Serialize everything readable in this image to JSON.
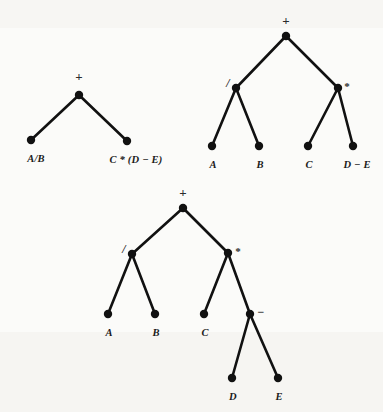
{
  "figure": {
    "background_color": "#fbfbf9",
    "ink_color": "#111111",
    "node_radius": 4.2,
    "edge_width": 2.6
  },
  "trees": [
    {
      "id": "tree-1",
      "caption": "Top-level tree: root plus with two compound operand leaves",
      "nodes": [
        {
          "id": "t1-root",
          "label": "+",
          "kind": "operator",
          "x": 79,
          "y": 95,
          "label_x": 79,
          "label_y": 77,
          "label_pos": "above"
        },
        {
          "id": "t1-left",
          "label": "A/B",
          "kind": "operand",
          "x": 31,
          "y": 140,
          "label_x": 36,
          "label_y": 153,
          "label_pos": "below"
        },
        {
          "id": "t1-right",
          "label": "C * (D − E)",
          "kind": "operand",
          "x": 127,
          "y": 141,
          "label_x": 136,
          "label_y": 154,
          "label_pos": "below"
        }
      ],
      "edges": [
        {
          "from": "t1-root",
          "to": "t1-left"
        },
        {
          "from": "t1-root",
          "to": "t1-right"
        }
      ]
    },
    {
      "id": "tree-2",
      "caption": "Second level of expansion: operators / and * expanded, D-E still a leaf",
      "nodes": [
        {
          "id": "t2-root",
          "label": "+",
          "kind": "operator",
          "x": 286,
          "y": 36,
          "label_x": 286,
          "label_y": 21,
          "label_pos": "above"
        },
        {
          "id": "t2-div",
          "label": "/",
          "kind": "operator",
          "x": 236,
          "y": 88,
          "label_x": 228,
          "label_y": 83,
          "label_pos": "left"
        },
        {
          "id": "t2-mul",
          "label": "*",
          "kind": "operator",
          "x": 338,
          "y": 88,
          "label_x": 347,
          "label_y": 86,
          "label_pos": "right"
        },
        {
          "id": "t2-a",
          "label": "A",
          "kind": "operand",
          "x": 212,
          "y": 146,
          "label_x": 213,
          "label_y": 159,
          "label_pos": "below"
        },
        {
          "id": "t2-b",
          "label": "B",
          "kind": "operand",
          "x": 259,
          "y": 146,
          "label_x": 260,
          "label_y": 159,
          "label_pos": "below"
        },
        {
          "id": "t2-c",
          "label": "C",
          "kind": "operand",
          "x": 308,
          "y": 146,
          "label_x": 309,
          "label_y": 159,
          "label_pos": "below"
        },
        {
          "id": "t2-de",
          "label": "D − E",
          "kind": "operand",
          "x": 353,
          "y": 146,
          "label_x": 357,
          "label_y": 159,
          "label_pos": "below"
        }
      ],
      "edges": [
        {
          "from": "t2-root",
          "to": "t2-div"
        },
        {
          "from": "t2-root",
          "to": "t2-mul"
        },
        {
          "from": "t2-div",
          "to": "t2-a"
        },
        {
          "from": "t2-div",
          "to": "t2-b"
        },
        {
          "from": "t2-mul",
          "to": "t2-c"
        },
        {
          "from": "t2-mul",
          "to": "t2-de"
        }
      ]
    },
    {
      "id": "tree-3",
      "caption": "Fully expanded tree: every leaf is a single variable",
      "nodes": [
        {
          "id": "t3-root",
          "label": "+",
          "kind": "operator",
          "x": 183,
          "y": 208,
          "label_x": 183,
          "label_y": 193,
          "label_pos": "above"
        },
        {
          "id": "t3-div",
          "label": "/",
          "kind": "operator",
          "x": 132,
          "y": 254,
          "label_x": 124,
          "label_y": 249,
          "label_pos": "left"
        },
        {
          "id": "t3-mul",
          "label": "*",
          "kind": "operator",
          "x": 228,
          "y": 253,
          "label_x": 238,
          "label_y": 251,
          "label_pos": "right"
        },
        {
          "id": "t3-a",
          "label": "A",
          "kind": "operand",
          "x": 108,
          "y": 314,
          "label_x": 109,
          "label_y": 327,
          "label_pos": "below"
        },
        {
          "id": "t3-b",
          "label": "B",
          "kind": "operand",
          "x": 155,
          "y": 314,
          "label_x": 156,
          "label_y": 327,
          "label_pos": "below"
        },
        {
          "id": "t3-c",
          "label": "C",
          "kind": "operand",
          "x": 204,
          "y": 314,
          "label_x": 205,
          "label_y": 327,
          "label_pos": "below"
        },
        {
          "id": "t3-sub",
          "label": "−",
          "kind": "operator",
          "x": 250,
          "y": 314,
          "label_x": 261,
          "label_y": 312,
          "label_pos": "right"
        },
        {
          "id": "t3-d",
          "label": "D",
          "kind": "operand",
          "x": 232,
          "y": 378,
          "label_x": 233,
          "label_y": 391,
          "label_pos": "below"
        },
        {
          "id": "t3-e",
          "label": "E",
          "kind": "operand",
          "x": 278,
          "y": 378,
          "label_x": 279,
          "label_y": 391,
          "label_pos": "below"
        }
      ],
      "edges": [
        {
          "from": "t3-root",
          "to": "t3-div"
        },
        {
          "from": "t3-root",
          "to": "t3-mul"
        },
        {
          "from": "t3-div",
          "to": "t3-a"
        },
        {
          "from": "t3-div",
          "to": "t3-b"
        },
        {
          "from": "t3-mul",
          "to": "t3-c"
        },
        {
          "from": "t3-mul",
          "to": "t3-sub"
        },
        {
          "from": "t3-sub",
          "to": "t3-d"
        },
        {
          "from": "t3-sub",
          "to": "t3-e"
        }
      ]
    }
  ]
}
